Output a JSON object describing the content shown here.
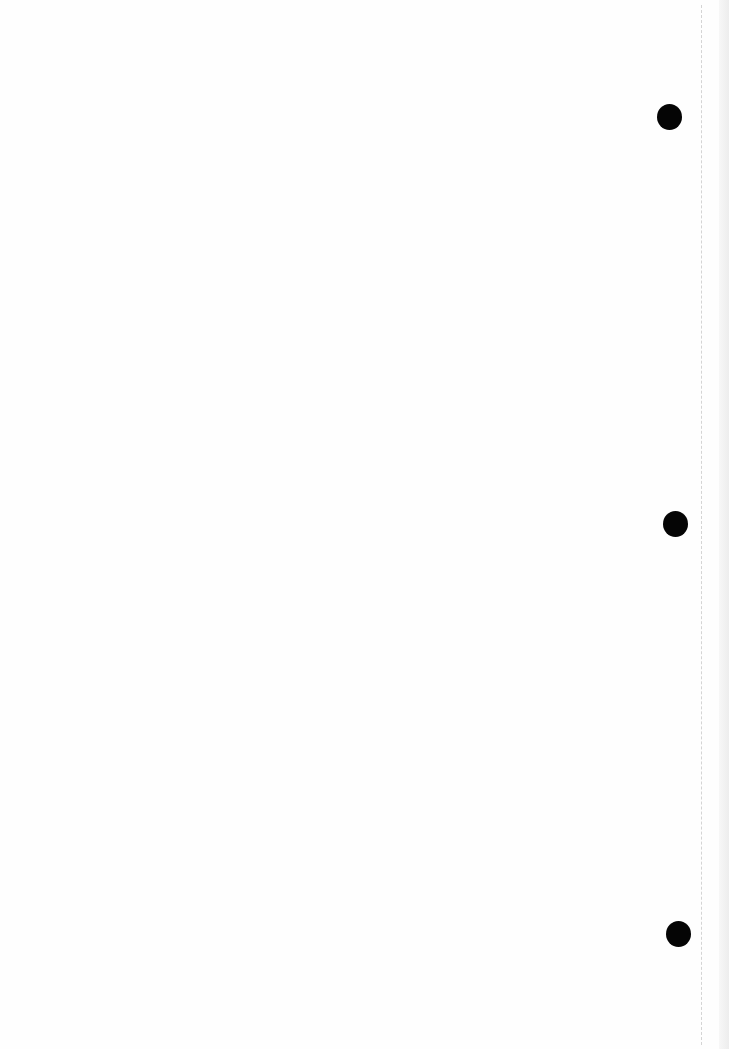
{
  "document": {
    "type": "scanned-blank-page",
    "text": "",
    "background_color": "#fefefe",
    "punch_holes": [
      {
        "x": 657,
        "y": 104,
        "w": 25,
        "h": 26
      },
      {
        "x": 663,
        "y": 511,
        "w": 25,
        "h": 26
      },
      {
        "x": 666,
        "y": 921,
        "w": 25,
        "h": 26
      }
    ],
    "fold_line_x": 701,
    "hole_color": "#050505"
  }
}
